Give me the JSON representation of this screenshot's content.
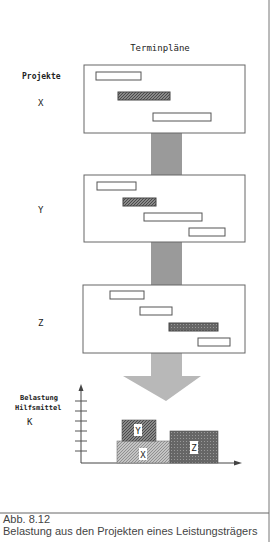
{
  "title": "Terminpläne",
  "projects_label": "Projekte",
  "colors": {
    "frame": "#666666",
    "bar_fill": "#ffffff",
    "bar_hatched": "#6e6e6e",
    "bar_dark": "#555555",
    "connector": "#9a9a9a",
    "arrow": "#b8b8b8",
    "x_block": "#a8a8a8",
    "y_block": "#6a6a6a",
    "z_block": "#707070"
  },
  "projects": [
    {
      "name": "X",
      "bars": [
        {
          "x": 96,
          "y": 72,
          "w": 45,
          "h": 8,
          "style": "empty"
        },
        {
          "x": 118,
          "y": 92,
          "w": 52,
          "h": 8,
          "style": "hatched"
        },
        {
          "x": 153,
          "y": 113,
          "w": 58,
          "h": 8,
          "style": "empty"
        }
      ]
    },
    {
      "name": "Y",
      "bars": [
        {
          "x": 97,
          "y": 182,
          "w": 39,
          "h": 8,
          "style": "empty"
        },
        {
          "x": 123,
          "y": 198,
          "w": 33,
          "h": 8,
          "style": "hatched"
        },
        {
          "x": 144,
          "y": 213,
          "w": 58,
          "h": 8,
          "style": "empty"
        },
        {
          "x": 189,
          "y": 228,
          "w": 36,
          "h": 8,
          "style": "empty"
        }
      ]
    },
    {
      "name": "Z",
      "bars": [
        {
          "x": 110,
          "y": 291,
          "w": 34,
          "h": 8,
          "style": "empty"
        },
        {
          "x": 140,
          "y": 307,
          "w": 32,
          "h": 8,
          "style": "empty"
        },
        {
          "x": 169,
          "y": 323,
          "w": 49,
          "h": 8,
          "style": "dark"
        },
        {
          "x": 198,
          "y": 338,
          "w": 32,
          "h": 8,
          "style": "empty"
        }
      ]
    }
  ],
  "load_chart": {
    "ylabel_line1": "Belastung",
    "ylabel_line2": "Hilfsmittel",
    "resource": "K",
    "blocks": [
      {
        "label": "X",
        "x": 117,
        "y": 441,
        "w": 53,
        "h": 22
      },
      {
        "label": "Y",
        "x": 122,
        "y": 420,
        "w": 34,
        "h": 21
      },
      {
        "label": "Z",
        "x": 170,
        "y": 431,
        "w": 48,
        "h": 32
      }
    ]
  },
  "caption": {
    "number": "Abb. 8.12",
    "text": "Belastung aus den Projekten eines Leistungsträgers"
  }
}
